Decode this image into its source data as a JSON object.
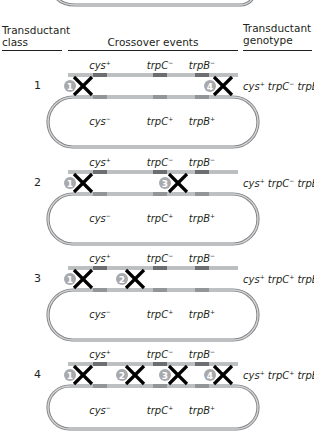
{
  "header": {
    "col1_line1": "Transductant",
    "col1_line2": "class",
    "col2": "Crossover events",
    "col3_line1": "Transductant",
    "col3_line2": "genotype"
  },
  "genes": {
    "donor": [
      {
        "name": "cys",
        "sign": "+"
      },
      {
        "name": "trpC",
        "sign": "−"
      },
      {
        "name": "trpB",
        "sign": "−"
      }
    ],
    "recipient": [
      {
        "name": "cys",
        "sign": "−"
      },
      {
        "name": "trpC",
        "sign": "+"
      },
      {
        "name": "trpB",
        "sign": "+"
      }
    ]
  },
  "colors": {
    "strand": "#a7a9ac",
    "strand_edge": "#808285",
    "marker": "#6d6e71",
    "cross": "#000000",
    "badge": "#a7a9ac",
    "text": "#231f20"
  },
  "rows": [
    {
      "class": "1",
      "crossovers": [
        "1",
        "4"
      ],
      "genotype": [
        {
          "g": "cys",
          "s": "+"
        },
        {
          "g": "trpC",
          "s": "−"
        },
        {
          "g": "trpB",
          "s": "−"
        }
      ]
    },
    {
      "class": "2",
      "crossovers": [
        "1",
        "3"
      ],
      "genotype": [
        {
          "g": "cys",
          "s": "+"
        },
        {
          "g": "trpC",
          "s": "−"
        },
        {
          "g": "trpB",
          "s": "+"
        }
      ]
    },
    {
      "class": "3",
      "crossovers": [
        "1",
        "2"
      ],
      "genotype": [
        {
          "g": "cys",
          "s": "+"
        },
        {
          "g": "trpC",
          "s": "+"
        },
        {
          "g": "trpB",
          "s": "+"
        }
      ]
    },
    {
      "class": "4",
      "crossovers": [
        "1",
        "2",
        "3",
        "4"
      ],
      "genotype": [
        {
          "g": "cys",
          "s": "+"
        },
        {
          "g": "trpC",
          "s": "+"
        },
        {
          "g": "trpB",
          "s": "−"
        }
      ]
    }
  ]
}
